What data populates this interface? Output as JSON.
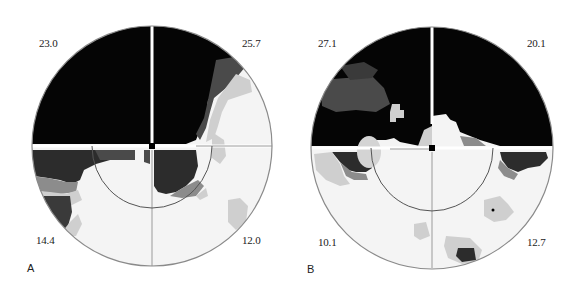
{
  "figure": {
    "panels": [
      {
        "label": "A",
        "quadrant_values": {
          "upper_left": "23.0",
          "upper_right": "25.7",
          "lower_left": "14.4",
          "lower_right": "12.0"
        }
      },
      {
        "label": "B",
        "quadrant_values": {
          "upper_left": "27.1",
          "upper_right": "20.1",
          "lower_left": "10.1",
          "lower_right": "12.7"
        }
      }
    ],
    "colors": {
      "dense_defect": "#050505",
      "dark_gray": "#4a4a4a",
      "mid_gray": "#8c8c8c",
      "light_gray": "#cfcfcf",
      "normal": "#f4f4f4",
      "outline": "#8a8a8a"
    }
  }
}
